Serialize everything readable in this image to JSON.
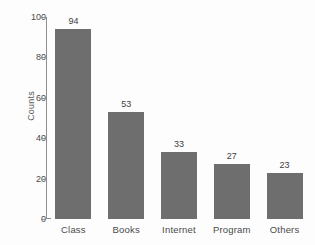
{
  "chart_data": {
    "type": "bar",
    "title": "",
    "xlabel": "",
    "ylabel": "Counts",
    "categories": [
      "Class",
      "Books",
      "Internet",
      "Program",
      "Others"
    ],
    "values": [
      94,
      53,
      33,
      27,
      23
    ],
    "value_labels": [
      "94",
      "53",
      "33",
      "27",
      "23"
    ],
    "ylim": [
      0,
      100
    ],
    "yticks": [
      0,
      20,
      40,
      60,
      80,
      100
    ],
    "ytick_labels": [
      "0",
      "20",
      "40",
      "60",
      "80",
      "100"
    ],
    "grid": false,
    "legend": null,
    "bar_color": "#6e6e6e",
    "axis_color": "#8e8e8e",
    "text_color": "#4a4a4a",
    "background_color": "#fdfdfd"
  }
}
